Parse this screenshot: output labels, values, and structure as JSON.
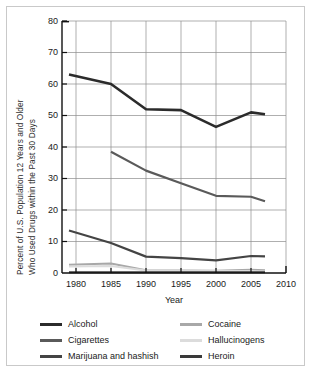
{
  "chart_data": {
    "type": "line",
    "title": "",
    "xlabel": "Year",
    "ylabel": "Percent of U.S. Population 12 Years and Older Who Used Drugs within the Past 30 Days",
    "ylabel_lines": [
      "Percent of U.S. Population 12 Years and Older",
      "Who Used Drugs within the Past 30 Days"
    ],
    "xlim": [
      1978,
      2010
    ],
    "ylim": [
      0,
      80
    ],
    "xticks": [
      1980,
      1985,
      1990,
      1995,
      2000,
      2005,
      2010
    ],
    "yticks": [
      0,
      10,
      20,
      30,
      40,
      50,
      60,
      70,
      80
    ],
    "grid": true,
    "legend_position": "below",
    "series": [
      {
        "name": "Alcohol",
        "color": "#2b2b2b",
        "x": [
          1979,
          1985,
          1990,
          1995,
          2000,
          2005,
          2007
        ],
        "values": [
          63,
          60,
          52,
          51.7,
          46.4,
          51,
          50.4
        ]
      },
      {
        "name": "Cigarettes",
        "color": "#5a5a5a",
        "x": [
          1985,
          1990,
          1995,
          2000,
          2005,
          2007
        ],
        "values": [
          38.5,
          32.5,
          28.5,
          24.5,
          24.2,
          22.8
        ]
      },
      {
        "name": "Marijuana and hashish",
        "color": "#444444",
        "x": [
          1979,
          1985,
          1990,
          1995,
          2000,
          2005,
          2007
        ],
        "values": [
          13.5,
          9.5,
          5.2,
          4.7,
          4.0,
          5.4,
          5.3
        ]
      },
      {
        "name": "Cocaine",
        "color": "#a8a8a8",
        "x": [
          1979,
          1985,
          1990,
          1995,
          2000,
          2005,
          2007
        ],
        "values": [
          2.6,
          3.0,
          0.9,
          0.8,
          0.7,
          1.0,
          0.9
        ]
      },
      {
        "name": "Hallucinogens",
        "color": "#dcdcdc",
        "x": [
          1979,
          1985,
          1990,
          1995,
          2000,
          2005,
          2007
        ],
        "values": [
          2.1,
          2.2,
          0.8,
          0.7,
          0.6,
          0.6,
          0.5
        ]
      },
      {
        "name": "Heroin",
        "color": "#3a3a3a",
        "x": [
          1979,
          1985,
          1990,
          1995,
          2000,
          2005,
          2007
        ],
        "values": [
          0.2,
          0.2,
          0.2,
          0.2,
          0.2,
          0.2,
          0.2
        ]
      }
    ]
  },
  "legend": {
    "left_column": [
      "Alcohol",
      "Cigarettes",
      "Marijuana and hashish"
    ],
    "right_column": [
      "Cocaine",
      "Hallucinogens",
      "Heroin"
    ]
  },
  "colors": {
    "alcohol": "#2b2b2b",
    "cigarettes": "#5a5a5a",
    "marijuana": "#444444",
    "cocaine": "#a8a8a8",
    "hallucinogens": "#dcdcdc",
    "heroin": "#3a3a3a",
    "grid": "#8c8c8c",
    "axis": "#111111",
    "border": "#c9c9c9"
  }
}
